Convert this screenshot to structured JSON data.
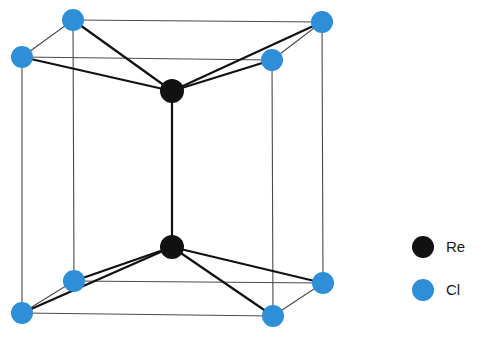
{
  "figure": {
    "background_color": "#ffffff",
    "width": 484,
    "height": 343
  },
  "colors": {
    "re_black": "#111111",
    "cl_blue": "#2E8FD6",
    "cell_edge": "#4a4a4a",
    "bond": "#111111",
    "text": "#1a1a1a"
  },
  "legend": {
    "items": [
      {
        "label": "Re",
        "color": "#111111",
        "shape": "circle",
        "cx": 423,
        "cy": 247,
        "r": 11,
        "text_x": 446,
        "text_y": 248
      },
      {
        "label": "Cl",
        "color": "#2E8FD6",
        "shape": "circle",
        "cx": 423,
        "cy": 290,
        "r": 11,
        "text_x": 446,
        "text_y": 291
      }
    ]
  },
  "chart_data": {
    "type": "diagram",
    "atoms": [
      {
        "id": "cl-top-back-left",
        "element": "Cl",
        "x": 73,
        "y": 20,
        "r": 11,
        "color": "#2E8FD6"
      },
      {
        "id": "cl-top-back-right",
        "element": "Cl",
        "x": 322,
        "y": 22,
        "r": 11,
        "color": "#2E8FD6"
      },
      {
        "id": "cl-top-front-left",
        "element": "Cl",
        "x": 22,
        "y": 57,
        "r": 11,
        "color": "#2E8FD6"
      },
      {
        "id": "cl-top-front-right",
        "element": "Cl",
        "x": 272,
        "y": 60,
        "r": 11,
        "color": "#2E8FD6"
      },
      {
        "id": "re-top",
        "element": "Re",
        "x": 172,
        "y": 91,
        "r": 12,
        "color": "#111111"
      },
      {
        "id": "re-bottom",
        "element": "Re",
        "x": 172,
        "y": 247,
        "r": 12,
        "color": "#111111"
      },
      {
        "id": "cl-bottom-back-left",
        "element": "Cl",
        "x": 74,
        "y": 281,
        "r": 11,
        "color": "#2E8FD6"
      },
      {
        "id": "cl-bottom-back-right",
        "element": "Cl",
        "x": 323,
        "y": 283,
        "r": 11,
        "color": "#2E8FD6"
      },
      {
        "id": "cl-bottom-front-left",
        "element": "Cl",
        "x": 22,
        "y": 313,
        "r": 11,
        "color": "#2E8FD6"
      },
      {
        "id": "cl-bottom-front-right",
        "element": "Cl",
        "x": 273,
        "y": 316,
        "r": 11,
        "color": "#2E8FD6"
      }
    ],
    "cell_edges": [
      {
        "from": "cl-top-back-left",
        "to": "cl-top-back-right"
      },
      {
        "from": "cl-top-front-left",
        "to": "cl-top-front-right"
      },
      {
        "from": "cl-top-back-left",
        "to": "cl-top-front-left"
      },
      {
        "from": "cl-top-back-right",
        "to": "cl-top-front-right"
      },
      {
        "from": "cl-bottom-back-left",
        "to": "cl-bottom-back-right"
      },
      {
        "from": "cl-bottom-front-left",
        "to": "cl-bottom-front-right"
      },
      {
        "from": "cl-bottom-back-left",
        "to": "cl-bottom-front-left"
      },
      {
        "from": "cl-bottom-back-right",
        "to": "cl-bottom-front-right"
      },
      {
        "from": "cl-top-back-left",
        "to": "cl-bottom-back-left"
      },
      {
        "from": "cl-top-back-right",
        "to": "cl-bottom-back-right"
      },
      {
        "from": "cl-top-front-left",
        "to": "cl-bottom-front-left"
      },
      {
        "from": "cl-top-front-right",
        "to": "cl-bottom-front-right"
      }
    ],
    "bonds": [
      {
        "from": "re-top",
        "to": "cl-top-back-left"
      },
      {
        "from": "re-top",
        "to": "cl-top-back-right"
      },
      {
        "from": "re-top",
        "to": "cl-top-front-left"
      },
      {
        "from": "re-top",
        "to": "cl-top-front-right"
      },
      {
        "from": "re-bottom",
        "to": "cl-bottom-back-left"
      },
      {
        "from": "re-bottom",
        "to": "cl-bottom-back-right"
      },
      {
        "from": "re-bottom",
        "to": "cl-bottom-front-left"
      },
      {
        "from": "re-bottom",
        "to": "cl-bottom-front-right"
      },
      {
        "from": "re-top",
        "to": "re-bottom"
      }
    ],
    "legend_entries": [
      "Re",
      "Cl"
    ]
  }
}
